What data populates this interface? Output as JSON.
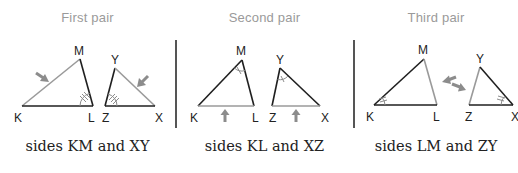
{
  "colors": {
    "dark_edge": "#1f1f1f",
    "highlight_edge": "#9a9a9a",
    "arrow": "#8c8c8c",
    "title": "#9a9a9a",
    "caption": "#222222",
    "divider": "#555555"
  },
  "panels": [
    {
      "title": "First pair",
      "caption": "sides KM and XY",
      "triangle_1": {
        "vertices": {
          "K": "K",
          "L": "L",
          "M": "M"
        },
        "highlighted_side": "KM",
        "marked_angle": "L",
        "angle_mark": "triple-tick"
      },
      "triangle_2": {
        "vertices": {
          "Z": "Z",
          "X": "X",
          "Y": "Y"
        },
        "highlighted_side": "XY",
        "marked_angle": "Z",
        "angle_mark": "triple-tick"
      },
      "arrows": [
        "arrow-to-KM",
        "arrow-to-XY"
      ]
    },
    {
      "title": "Second pair",
      "caption": "sides KL and XZ",
      "triangle_1": {
        "vertices": {
          "K": "K",
          "L": "L",
          "M": "M"
        },
        "highlighted_side": "KL",
        "marked_angle": "M",
        "angle_mark": "single-tick"
      },
      "triangle_2": {
        "vertices": {
          "Z": "Z",
          "X": "X",
          "Y": "Y"
        },
        "highlighted_side": "XZ",
        "marked_angle": "Y",
        "angle_mark": "single-tick"
      },
      "arrows": [
        "arrow-up-to-KL",
        "arrow-up-to-XZ"
      ]
    },
    {
      "title": "Third pair",
      "caption": "sides LM and ZY",
      "triangle_1": {
        "vertices": {
          "K": "K",
          "L": "L",
          "M": "M"
        },
        "highlighted_side": "LM",
        "marked_angle": "K",
        "angle_mark": "double-tick"
      },
      "triangle_2": {
        "vertices": {
          "Z": "Z",
          "X": "X",
          "Y": "Y"
        },
        "highlighted_side": "ZY",
        "marked_angle": "X",
        "angle_mark": "double-tick"
      },
      "arrows": [
        "arrow-to-LM",
        "arrow-to-ZY"
      ]
    }
  ]
}
